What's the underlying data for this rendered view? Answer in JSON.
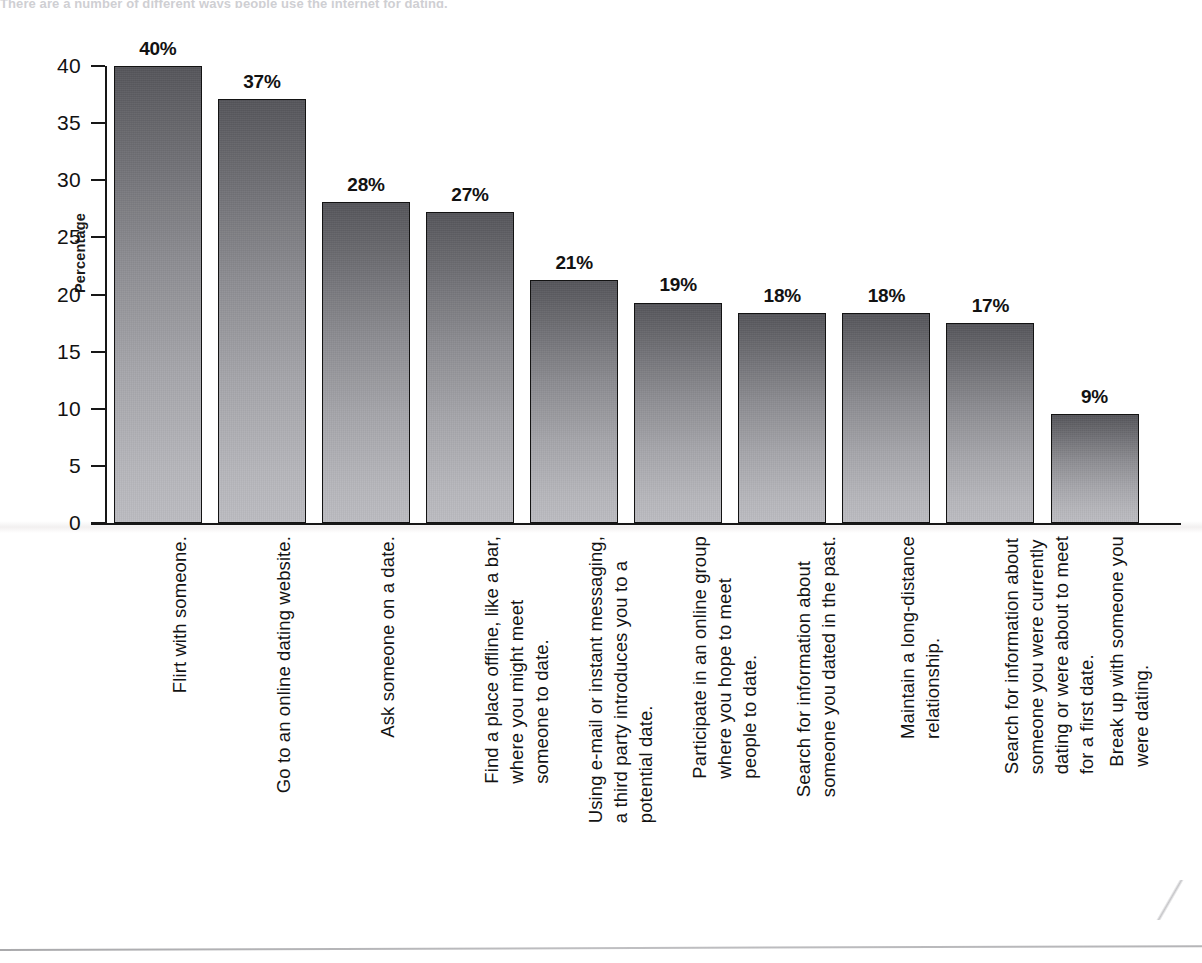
{
  "page": {
    "top_cut_text": "There are a number of different ways people use the internet for dating.",
    "bottom_rule": "horizontal-rule"
  },
  "chart_data": {
    "type": "bar",
    "title": "",
    "xlabel": "",
    "ylabel": "Percentage",
    "ylim": [
      0,
      40
    ],
    "ytick_step": 5,
    "ytick_labels": [
      "40",
      "35",
      "30",
      "25",
      "20",
      "15",
      "10",
      "5",
      "0"
    ],
    "grid": false,
    "legend": false,
    "bar_color_top": "#55555a",
    "bar_color_bottom": "#bcbcc1",
    "bar_border_color": "#131313",
    "axis_color": "#171717",
    "categories": [
      "Flirt with someone.",
      "Go to an online dating website.",
      "Ask someone on a date.",
      "Find a place offline, like a bar, where you might meet someone to date.",
      "Using e-mail or instant messaging, a third party introduces you to a potential date.",
      "Participate in an online group where you hope to meet people to date.",
      "Search for information about someone you dated in the past.",
      "Maintain a long-distance relationship.",
      "Search for information about someone you were currently dating or were about to meet for a first date.",
      "Break up with someone you were dating."
    ],
    "category_lines": [
      [
        "Flirt with someone."
      ],
      [
        "Go to an online dating website."
      ],
      [
        "Ask someone on a date."
      ],
      [
        "Find a place offline, like a bar,",
        "where you might meet",
        "someone to date."
      ],
      [
        "Using e-mail or instant messaging,",
        "a third party introduces you to a",
        "potential date."
      ],
      [
        "Participate in an online group",
        "where you hope to meet",
        "people to date."
      ],
      [
        "Search for information about",
        "someone you dated in the past."
      ],
      [
        "Maintain a long-distance",
        "relationship."
      ],
      [
        "Search for information about",
        "someone you were currently",
        "dating or were about to meet",
        "for a first date."
      ],
      [
        "Break up with someone you",
        "were dating."
      ]
    ],
    "values": [
      40.0,
      37.1,
      28.1,
      27.2,
      21.3,
      19.3,
      18.4,
      18.4,
      17.5,
      9.5
    ],
    "value_labels": [
      "40%",
      "37%",
      "28%",
      "27%",
      "21%",
      "19%",
      "18%",
      "18%",
      "17%",
      "9%"
    ]
  }
}
